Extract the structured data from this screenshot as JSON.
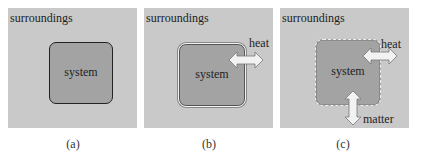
{
  "figure": {
    "panels": [
      {
        "id": "a",
        "surroundings_label": "surroundings",
        "system_label": "system",
        "boundary": "closed-solid",
        "caption": "(a)"
      },
      {
        "id": "b",
        "surroundings_label": "surroundings",
        "system_label": "system",
        "boundary": "double-line",
        "arrows": [
          {
            "label": "heat",
            "direction": "horizontal"
          }
        ],
        "caption": "(b)"
      },
      {
        "id": "c",
        "surroundings_label": "surroundings",
        "system_label": "system",
        "boundary": "dashed",
        "arrows": [
          {
            "label": "heat",
            "direction": "horizontal"
          },
          {
            "label": "matter",
            "direction": "vertical"
          }
        ],
        "caption": "(c)"
      }
    ],
    "colors": {
      "surroundings": "#c9c9c9",
      "system": "#a3a3a3",
      "arrow_fill": "#f2f2f2"
    }
  }
}
